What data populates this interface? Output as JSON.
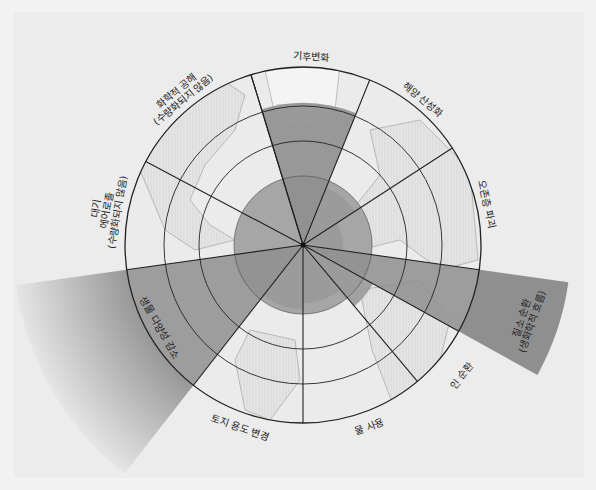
{
  "diagram": {
    "type": "planetary-boundaries-radial",
    "center": {
      "x": 303,
      "y": 245
    },
    "rings": {
      "inner_safe_radius": 69,
      "ring2_radius": 104,
      "ring3_radius": 139,
      "outer_radius": 178
    },
    "colors": {
      "background": "#ececec",
      "globe_land": "#dcdcdc",
      "globe_ocean": "#e9e9e9",
      "safe_zone": "#a6a6a6",
      "exceeded": "#8f8f8f",
      "line": "#222222"
    },
    "sectors": [
      {
        "id": "climate",
        "label": [
          "기후변화"
        ],
        "start": -17,
        "end": 22,
        "value": 142,
        "status": "exceeded"
      },
      {
        "id": "ocean",
        "label": [
          "해양 산성화"
        ],
        "start": 22,
        "end": 57,
        "value": 62,
        "status": "safe"
      },
      {
        "id": "ozone",
        "label": [
          "오존층 파괴"
        ],
        "start": 57,
        "end": 98,
        "value": 40,
        "status": "safe"
      },
      {
        "id": "nitrogen",
        "label": [
          "질소 순환",
          "(생화학적 흐름)"
        ],
        "start": 98,
        "end": 119,
        "value": 268,
        "status": "far-exceeded"
      },
      {
        "id": "phosphorus",
        "label": [
          "인 순환"
        ],
        "start": 119,
        "end": 140,
        "value": 80,
        "status": "safe"
      },
      {
        "id": "water",
        "label": [
          "물 사용"
        ],
        "start": 140,
        "end": 180,
        "value": 58,
        "status": "safe"
      },
      {
        "id": "land",
        "label": [
          "토지 용도 변경"
        ],
        "start": 180,
        "end": 218,
        "value": 64,
        "status": "safe"
      },
      {
        "id": "biodiversity",
        "label": [
          "생물 다양성 감소"
        ],
        "start": 218,
        "end": 262,
        "value": 290,
        "status": "far-exceeded"
      },
      {
        "id": "aerosol",
        "label": [
          "대기",
          "에어로졸",
          "(수량화되지 않음)"
        ],
        "start": 262,
        "end": 298,
        "value": null,
        "status": "unquantified"
      },
      {
        "id": "chemical",
        "label": [
          "화학적 공해",
          "(수량화되지 않음)"
        ],
        "start": 298,
        "end": 343,
        "value": null,
        "status": "unquantified"
      }
    ]
  }
}
